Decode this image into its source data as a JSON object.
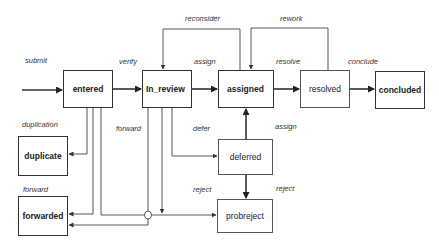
{
  "diagram": {
    "type": "state-transition",
    "states": [
      {
        "id": "entered",
        "label": "entered",
        "style": "bold"
      },
      {
        "id": "in_review",
        "label": "In_review",
        "style": "bold"
      },
      {
        "id": "assigned",
        "label": "assigned",
        "style": "bold"
      },
      {
        "id": "resolved",
        "label": "resolved",
        "style": "thin"
      },
      {
        "id": "concluded",
        "label": "concluded",
        "style": "bold"
      },
      {
        "id": "duplicate",
        "label": "duplicate",
        "style": "bold"
      },
      {
        "id": "forwarded",
        "label": "forwarded",
        "style": "bold"
      },
      {
        "id": "deferred",
        "label": "deferred",
        "style": "thin"
      },
      {
        "id": "probreject",
        "label": "probreject",
        "style": "thin"
      }
    ],
    "transitions": [
      {
        "label": "submit",
        "from": "start",
        "to": "entered"
      },
      {
        "label": "verify",
        "from": "entered",
        "to": "in_review"
      },
      {
        "label": "assign",
        "from": "in_review",
        "to": "assigned"
      },
      {
        "label": "resolve",
        "from": "assigned",
        "to": "resolved"
      },
      {
        "label": "conclude",
        "from": "resolved",
        "to": "concluded"
      },
      {
        "label": "reconsider",
        "from": "assigned",
        "to": "in_review"
      },
      {
        "label": "rework",
        "from": "resolved",
        "to": "assigned"
      },
      {
        "label": "duplication",
        "from": "entered",
        "to": "duplicate"
      },
      {
        "label": "forward",
        "from": "entered",
        "to": "forwarded"
      },
      {
        "label": "forward",
        "from": "in_review",
        "to": "forwarded"
      },
      {
        "label": "defer",
        "from": "in_review",
        "to": "deferred"
      },
      {
        "label": "assign",
        "from": "deferred",
        "to": "assigned"
      },
      {
        "label": "reject",
        "from": "in_review",
        "to": "probreject"
      },
      {
        "label": "reject",
        "from": "deferred",
        "to": "probreject"
      }
    ]
  },
  "labels": {
    "submit": "submit",
    "verify": "verify",
    "assign_top": "assign",
    "resolve": "resolve",
    "conclude": "conclude",
    "reconsider": "reconsider",
    "rework": "rework",
    "duplication": "duplication",
    "forward_left": "forward",
    "forward_mid": "forward",
    "defer": "defer",
    "assign_mid": "assign",
    "reject_left": "reject",
    "reject_right": "reject"
  }
}
